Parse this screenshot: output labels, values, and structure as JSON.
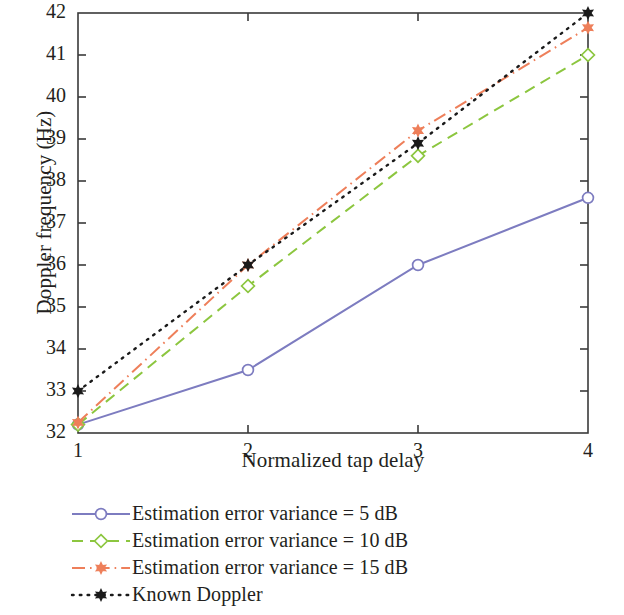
{
  "chart_data": {
    "type": "line",
    "title": "",
    "xlabel": "Normalized tap delay",
    "ylabel": "Doppler frequency (Hz)",
    "x": [
      1,
      2,
      3,
      4
    ],
    "xlim": [
      1,
      4
    ],
    "ylim": [
      32,
      42
    ],
    "xticks": [
      "1",
      "2",
      "3",
      "4"
    ],
    "yticks": [
      "32",
      "33",
      "34",
      "35",
      "36",
      "37",
      "38",
      "39",
      "40",
      "41",
      "42"
    ],
    "grid": false,
    "legend_position": "below-left",
    "series": [
      {
        "name": "Estimation error variance = 5 dB",
        "values": [
          32.2,
          33.5,
          36.0,
          37.6
        ],
        "color": "#7d7cc0",
        "dash": "none",
        "marker": "circle-open"
      },
      {
        "name": "Estimation error variance = 10 dB",
        "values": [
          32.2,
          35.5,
          38.6,
          41.0
        ],
        "color": "#8cc63f",
        "dash": "dashed",
        "marker": "diamond-open"
      },
      {
        "name": "Estimation error variance = 15 dB",
        "values": [
          32.25,
          36.0,
          39.2,
          41.65
        ],
        "color": "#ee7f5a",
        "dash": "dash-dot",
        "marker": "star-filled"
      },
      {
        "name": "Known Doppler",
        "values": [
          33.0,
          36.0,
          38.9,
          42.0
        ],
        "color": "#1a1a1a",
        "dash": "dotted",
        "marker": "star-filled"
      }
    ]
  },
  "legend": {
    "items": [
      {
        "label": "Estimation error variance = 5 dB"
      },
      {
        "label": "Estimation error variance = 10 dB"
      },
      {
        "label": "Estimation error variance = 15 dB"
      },
      {
        "label": "Known Doppler"
      }
    ]
  },
  "axes": {
    "x_label": "Normalized tap delay",
    "y_label": "Doppler frequency (Hz)",
    "x_tick_labels": [
      "1",
      "2",
      "3",
      "4"
    ],
    "y_tick_labels": [
      "32",
      "33",
      "34",
      "35",
      "36",
      "37",
      "38",
      "39",
      "40",
      "41",
      "42"
    ]
  },
  "colors": {
    "series_1": "#7d7cc0",
    "series_2": "#8cc63f",
    "series_3": "#ee7f5a",
    "series_4": "#1a1a1a",
    "axis": "#3a3a3a",
    "text": "#231f20"
  }
}
